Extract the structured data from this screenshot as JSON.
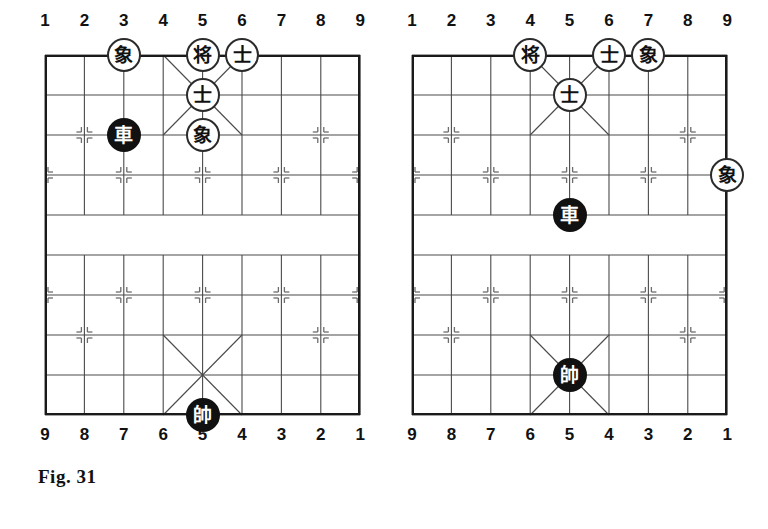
{
  "page": {
    "background_color": "#ffffff",
    "ink_color": "#111111"
  },
  "figures": [
    {
      "id": "fig-31",
      "caption": "Fig. 31",
      "board": {
        "files": 9,
        "ranks": 10,
        "origin_x": 45,
        "origin_y": 55,
        "cell_w": 39.4,
        "cell_h": 40.0,
        "top_labels": [
          "1",
          "2",
          "3",
          "4",
          "5",
          "6",
          "7",
          "8",
          "9"
        ],
        "bottom_labels": [
          "9",
          "8",
          "7",
          "6",
          "5",
          "4",
          "3",
          "2",
          "1"
        ],
        "river_top_rank": 4,
        "river_bottom_rank": 5,
        "palaces": [
          "top",
          "bottom"
        ],
        "star_points": "standard"
      },
      "pieces": [
        {
          "glyph": "象",
          "name": "black-elephant",
          "color": "white-piece",
          "file": 3,
          "rank": 0
        },
        {
          "glyph": "将",
          "name": "black-general",
          "color": "white-piece",
          "file": 5,
          "rank": 0
        },
        {
          "glyph": "士",
          "name": "black-advisor",
          "color": "white-piece",
          "file": 6,
          "rank": 0
        },
        {
          "glyph": "士",
          "name": "black-advisor",
          "color": "white-piece",
          "file": 5,
          "rank": 1
        },
        {
          "glyph": "車",
          "name": "red-chariot",
          "color": "black-piece",
          "file": 3,
          "rank": 2
        },
        {
          "glyph": "象",
          "name": "black-elephant",
          "color": "white-piece",
          "file": 5,
          "rank": 2
        },
        {
          "glyph": "帥",
          "name": "red-general",
          "color": "black-piece",
          "file": 5,
          "rank": 9
        }
      ]
    },
    {
      "id": "fig-32",
      "caption": "Fig. 32",
      "board": {
        "files": 9,
        "ranks": 10,
        "origin_x": 28,
        "origin_y": 55,
        "cell_w": 39.4,
        "cell_h": 40.0,
        "top_labels": [
          "1",
          "2",
          "3",
          "4",
          "5",
          "6",
          "7",
          "8",
          "9"
        ],
        "bottom_labels": [
          "9",
          "8",
          "7",
          "6",
          "5",
          "4",
          "3",
          "2",
          "1"
        ],
        "river_top_rank": 4,
        "river_bottom_rank": 5,
        "palaces": [
          "top",
          "bottom"
        ],
        "star_points": "standard"
      },
      "pieces": [
        {
          "glyph": "将",
          "name": "black-general",
          "color": "white-piece",
          "file": 4,
          "rank": 0
        },
        {
          "glyph": "士",
          "name": "black-advisor",
          "color": "white-piece",
          "file": 6,
          "rank": 0
        },
        {
          "glyph": "象",
          "name": "black-elephant",
          "color": "white-piece",
          "file": 7,
          "rank": 0
        },
        {
          "glyph": "士",
          "name": "black-advisor",
          "color": "white-piece",
          "file": 5,
          "rank": 1
        },
        {
          "glyph": "象",
          "name": "black-elephant",
          "color": "white-piece",
          "file": 9,
          "rank": 3
        },
        {
          "glyph": "車",
          "name": "red-chariot",
          "color": "black-piece",
          "file": 5,
          "rank": 4
        },
        {
          "glyph": "帥",
          "name": "red-general",
          "color": "black-piece",
          "file": 5,
          "rank": 8
        }
      ]
    }
  ]
}
